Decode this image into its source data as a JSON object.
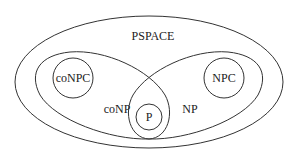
{
  "diagram": {
    "type": "complexity-class-venn",
    "stroke_color": "#333333",
    "background": "#ffffff",
    "regions": [
      {
        "id": "pspace",
        "label": "PSPACE",
        "shape": "ellipse",
        "cx": 149,
        "cy": 82,
        "rx": 134,
        "ry": 66,
        "label_x": 153,
        "label_y": 40
      },
      {
        "id": "conp",
        "label": "coNP",
        "shape": "ellipse-tilted",
        "label_x": 117,
        "label_y": 113
      },
      {
        "id": "np",
        "label": "NP",
        "shape": "ellipse-tilted",
        "label_x": 190,
        "label_y": 113
      },
      {
        "id": "conpc",
        "label": "coNPC",
        "shape": "circle",
        "cx": 73,
        "cy": 78,
        "r": 20
      },
      {
        "id": "npc",
        "label": "NPC",
        "shape": "circle",
        "cx": 224,
        "cy": 78,
        "r": 20
      },
      {
        "id": "p",
        "label": "P",
        "shape": "circle",
        "cx": 149,
        "cy": 117,
        "r": 13
      }
    ]
  }
}
